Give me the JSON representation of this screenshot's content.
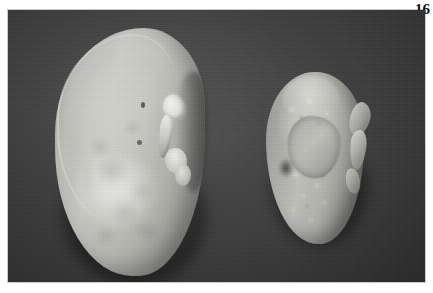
{
  "figure": {
    "number_label": "16",
    "caption": ""
  },
  "photograph": {
    "type": "black-and-white gross pathology photograph",
    "background_color": "#3b3b3c",
    "border_color": "#c9c9c9",
    "page_background": "#ffffff"
  },
  "specimens": [
    {
      "id": "kidney-left",
      "position": "left",
      "description": "large smooth pale kidney, intact capsule, convex lateral border",
      "surface": "smooth, finely mottled",
      "features": [
        "upper pole rim highlight",
        "convex lateral mid-bulge",
        "medial hilar notch",
        "bright hilar vessel stumps",
        "bright ureteric stump",
        "small dark capsular flecks"
      ],
      "tone": "#c4c4bf"
    },
    {
      "id": "kidney-right",
      "position": "right",
      "description": "small shrunken irregular kidney with coarse nodular granular surface",
      "surface": "coarsely granular and nodular, scarred",
      "features": [
        "upper pole lobule",
        "central scarred plate",
        "adherent perinephric tissue tags along lateral edge",
        "dark surface recess",
        "irregular contracted outline"
      ],
      "tone": "#b2b2ad"
    }
  ],
  "colors": {
    "photo_background": "#3b3b3c",
    "specimen_light": "#d2d2cd",
    "specimen_mid": "#b2b2ad",
    "specimen_dark": "#6e6e6b",
    "label_text": "#111111",
    "page": "#ffffff"
  }
}
